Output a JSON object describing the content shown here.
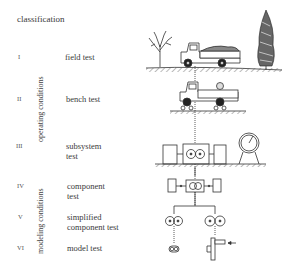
{
  "title": "classification",
  "groups": {
    "operating": "operating conditions",
    "modeling": "modeling conditions"
  },
  "levels": [
    {
      "numeral": "I",
      "label_lines": [
        "field test"
      ]
    },
    {
      "numeral": "II",
      "label_lines": [
        "bench test"
      ]
    },
    {
      "numeral": "III",
      "label_lines": [
        "subsystem",
        "test"
      ]
    },
    {
      "numeral": "IV",
      "label_lines": [
        "component",
        "test"
      ]
    },
    {
      "numeral": "V",
      "label_lines": [
        "simplified",
        "component test"
      ]
    },
    {
      "numeral": "VI",
      "label_lines": [
        "model test"
      ]
    }
  ],
  "illustrations": [
    {
      "level": "I",
      "depicts": "truck driving on ground between two trees"
    },
    {
      "level": "II",
      "depicts": "truck on test rig rollers"
    },
    {
      "level": "III",
      "depicts": "drivetrain gear unit between two machines with gauge"
    },
    {
      "level": "IV",
      "depicts": "single gear unit between two boxes"
    },
    {
      "level": "V",
      "depicts": "two gear pairs"
    },
    {
      "level": "VI",
      "depicts": "small gear pair model and lever test with load arrow"
    }
  ]
}
